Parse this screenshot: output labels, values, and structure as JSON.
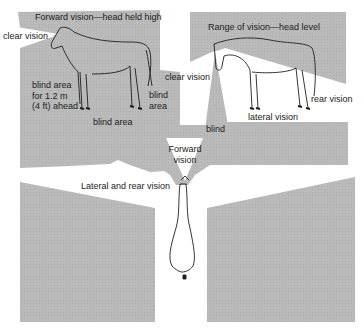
{
  "colors": {
    "shade": "#b9b9b9",
    "background": "#ffffff",
    "ink": "#1e1e1e"
  },
  "labels": {
    "forward_title": "Forward vision—head held high",
    "clear_vision_left": "clear vision",
    "blind_area_ahead": [
      "blind area",
      "for 1.2 m",
      "(4 ft) ahead"
    ],
    "blind_area_rear": [
      "blind",
      "area"
    ],
    "blind_area_under": "blind area",
    "range_title": "Range of vision—head level",
    "clear_vision_right": "clear vision",
    "rear_vision": "rear vision",
    "lateral_vision": "lateral vision",
    "blind": "blind",
    "forward_vision": [
      "Forward",
      "vision"
    ],
    "lateral_rear_vision": "Lateral and rear vision"
  }
}
